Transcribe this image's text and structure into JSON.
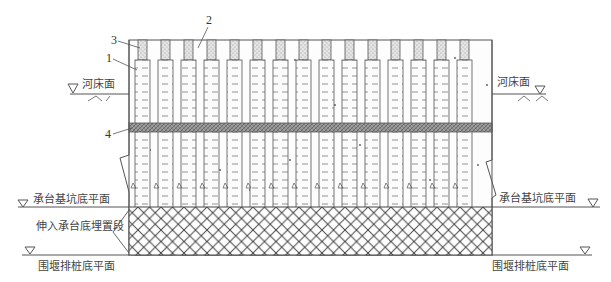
{
  "diagram": {
    "type": "engineering-section",
    "labels": {
      "riverbed_left": "河床面",
      "riverbed_right": "河床面",
      "cap_pit_bottom_left": "承台基坑底平面",
      "cap_pit_bottom_right": "承台基坑底平面",
      "embedded_section": "伸入承台底埋置段",
      "pile_bottom_left": "围堰排桩底平面",
      "pile_bottom_right": "围堰排桩底平面"
    },
    "callouts": [
      "1",
      "2",
      "3",
      "4"
    ],
    "pile_count": 15,
    "colors": {
      "line": "#555555",
      "band_fill": "#9a9a9a",
      "stipple_fill": "#d8d8d8",
      "hatch": "#444444",
      "background": "#ffffff"
    }
  }
}
